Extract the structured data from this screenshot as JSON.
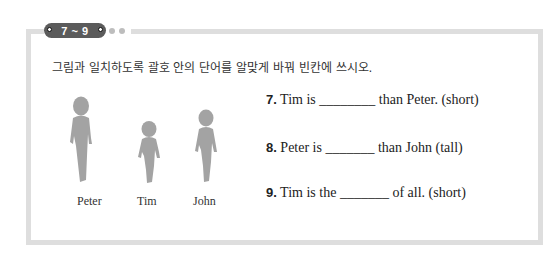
{
  "badge": {
    "label": "7 ~ 9",
    "dots": 2
  },
  "instruction": "그림과 일치하도록 괄호 안의 단어를 알맞게 바꿔 빈칸에 쓰시오.",
  "figures": [
    {
      "name": "Peter",
      "relative_height": "tallest"
    },
    {
      "name": "Tim",
      "relative_height": "shortest"
    },
    {
      "name": "John",
      "relative_height": "middle"
    }
  ],
  "questions": [
    {
      "number": "7.",
      "before": "Tim is ",
      "blank": "________",
      "after": " than Peter. (short)"
    },
    {
      "number": "8.",
      "before": "Peter is ",
      "blank": "_______",
      "after": " than John (tall)"
    },
    {
      "number": "9.",
      "before": "Tim is the ",
      "blank": "_______",
      "after": " of all. (short)"
    }
  ],
  "colors": {
    "frame": "#dedede",
    "badge": "#5b5b5b",
    "silhouette": "#a3a3a3"
  }
}
